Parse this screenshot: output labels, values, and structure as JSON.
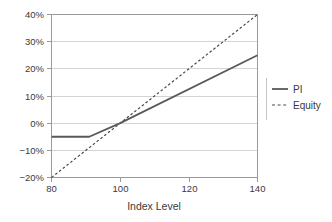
{
  "chart_data": {
    "type": "line",
    "title": "",
    "xlabel": "Index Level",
    "ylabel": "",
    "xlim": [
      80,
      140
    ],
    "ylim": [
      -20,
      40
    ],
    "grid": true,
    "legend_position": "right",
    "x_ticks": [
      80,
      100,
      120,
      140
    ],
    "x_tick_labels": [
      "80",
      "100",
      "120",
      "140"
    ],
    "y_ticks": [
      -20,
      -10,
      0,
      10,
      20,
      30,
      40
    ],
    "y_tick_labels": [
      "−20%",
      "−10%",
      "0%",
      "10%",
      "20%",
      "30%",
      "40%"
    ],
    "series": [
      {
        "name": "PI",
        "style": "solid",
        "color": "#595959",
        "points": [
          {
            "x": 80,
            "y": -5
          },
          {
            "x": 91,
            "y": -5
          },
          {
            "x": 100,
            "y": 0
          },
          {
            "x": 140,
            "y": 25
          }
        ]
      },
      {
        "name": "Equity",
        "style": "dashed",
        "color": "#4a4a4a",
        "points": [
          {
            "x": 80,
            "y": -20
          },
          {
            "x": 100,
            "y": 0
          },
          {
            "x": 140,
            "y": 40
          }
        ]
      }
    ],
    "legend": [
      {
        "label": "PI",
        "style": "solid"
      },
      {
        "label": "Equity",
        "style": "dashed"
      }
    ]
  },
  "axis": {
    "x_label": "Index Level",
    "x_tick_80": "80",
    "x_tick_100": "100",
    "x_tick_120": "120",
    "x_tick_140": "140",
    "y_tick_40": "40%",
    "y_tick_30": "30%",
    "y_tick_20": "20%",
    "y_tick_10": "10%",
    "y_tick_0": "0%",
    "y_tick_neg10": "−10%",
    "y_tick_neg20": "−20%"
  },
  "legend": {
    "item_pi": "PI",
    "item_equity": "Equity"
  },
  "colors": {
    "background": "#ffffff",
    "grid": "#c9c9c9",
    "axis": "#9a9a9a",
    "pi_line": "#595959",
    "equity_line": "#4a4a4a",
    "text": "#3a3a3a"
  }
}
